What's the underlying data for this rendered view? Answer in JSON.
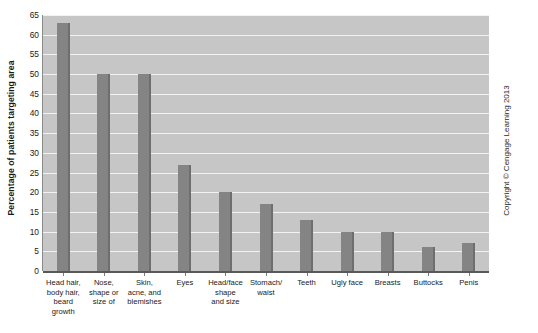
{
  "chart_data": {
    "type": "bar",
    "title": "",
    "xlabel": "",
    "ylabel": "Percentage of patients targeting area",
    "ylim": [
      0,
      65
    ],
    "yticks": [
      0,
      5,
      10,
      15,
      20,
      25,
      30,
      35,
      40,
      45,
      50,
      55,
      60,
      65
    ],
    "grid": true,
    "legend": false,
    "categories": [
      "Head hair, body hair, beard growth",
      "Nose, shape or size of",
      "Skin, acne, and blemishes",
      "Eyes",
      "Head/face shape and size",
      "Stomach/ waist",
      "Teeth",
      "Ugly face",
      "Breasts",
      "Buttocks",
      "Penis"
    ],
    "category_lines": [
      [
        "Head hair,",
        "body hair,",
        "beard",
        "growth"
      ],
      [
        "Nose,",
        "shape or",
        "size of"
      ],
      [
        "Skin,",
        "acne, and",
        "blemishes"
      ],
      [
        "Eyes"
      ],
      [
        "Head/face",
        "shape",
        "and size"
      ],
      [
        "Stomach/",
        "waist"
      ],
      [
        "Teeth"
      ],
      [
        "Ugly face"
      ],
      [
        "Breasts"
      ],
      [
        "Buttocks"
      ],
      [
        "Penis"
      ]
    ],
    "values": [
      63,
      50,
      50,
      27,
      20,
      17,
      13,
      10,
      10,
      6,
      7
    ],
    "bar_color": "#848484",
    "plot_background": "#c6c6c6",
    "gridline_color": "#f2f2f2"
  },
  "footer": {
    "copyright": "Copyright © Cengage Learning 2013"
  }
}
